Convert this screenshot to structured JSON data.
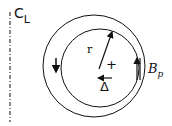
{
  "diagram": {
    "centerline_label": "C",
    "centerline_sub": "L",
    "radius_label": "r",
    "plus_label": "+",
    "shift_label": "Δ",
    "field_label": "B",
    "field_sub": "p",
    "colors": {
      "stroke": "#111111",
      "background": "#ffffff"
    }
  }
}
